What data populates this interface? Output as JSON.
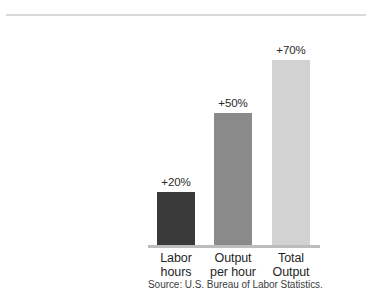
{
  "chart_data": {
    "type": "bar",
    "title": "",
    "subtitle": "",
    "xlabel": "",
    "ylabel": "",
    "categories": [
      "Labor hours",
      "Output per hour",
      "Total Output"
    ],
    "category_lines": [
      [
        "Labor",
        "hours"
      ],
      [
        "Output",
        "per hour"
      ],
      [
        "Total",
        "Output"
      ]
    ],
    "values": [
      20,
      50,
      70
    ],
    "value_labels": [
      "+20%",
      "+50%",
      "+70%"
    ],
    "bar_colors": [
      "#3a3a3a",
      "#8a8a8a",
      "#d2d2d2"
    ],
    "ylim": [
      0,
      71
    ],
    "grid": false,
    "legend": "none",
    "axis_line_color": "#bdbdbd",
    "orientation": "vertical"
  },
  "figure": {
    "source_note": "Source: U.S. Bureau of Labor Statistics.",
    "rule_color": "#d9d9d9",
    "background": "#ffffff"
  }
}
